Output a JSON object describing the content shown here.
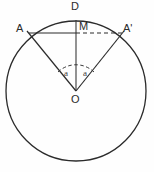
{
  "figure": {
    "kind": "circle-geometry-diagram",
    "background_color": "#fefefe",
    "stroke_color": "#2b2b2b",
    "width": 154,
    "height": 172
  },
  "circle": {
    "name": "main-circle",
    "center_x": 76,
    "center_y": 91,
    "radius": 70
  },
  "points": {
    "D": {
      "label": "D",
      "x": 76,
      "y": 21,
      "label_x": 72,
      "label_y": 1
    },
    "M": {
      "label": "M",
      "x": 76,
      "y": 33,
      "label_x": 78,
      "label_y": 22
    },
    "A": {
      "label": "A",
      "x": 29,
      "y": 33,
      "label_x": 17,
      "label_y": 24
    },
    "Aprime": {
      "label": "A'",
      "x": 122,
      "y": 33,
      "label_x": 123,
      "label_y": 24
    },
    "O": {
      "label": "O",
      "x": 76,
      "y": 91,
      "label_x": 72,
      "label_y": 94
    }
  },
  "angles": {
    "left": {
      "label": "a",
      "x": 63,
      "y": 72
    },
    "right": {
      "label": "a",
      "x": 83,
      "y": 72
    },
    "arc_radius": 26
  },
  "segments": [
    {
      "name": "chord-A-M",
      "style": "solid",
      "from": "A",
      "to": "M"
    },
    {
      "name": "chord-M-Aprime",
      "style": "dashed",
      "from": "M",
      "to": "Aprime"
    },
    {
      "name": "radius-O-A",
      "style": "solid",
      "from": "O",
      "to": "A"
    },
    {
      "name": "radius-O-Aprime",
      "style": "solid",
      "from": "O",
      "to": "Aprime"
    },
    {
      "name": "axis-D-O",
      "style": "solid",
      "from": "D",
      "to": "O"
    },
    {
      "name": "angle-arc",
      "style": "dashed",
      "from": "O",
      "to": "arc"
    }
  ]
}
